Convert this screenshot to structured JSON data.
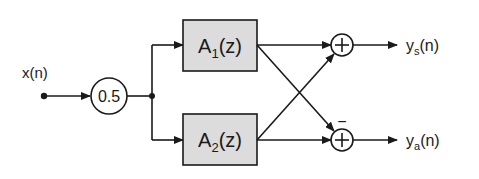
{
  "diagram": {
    "colors": {
      "line": "#1a1a1a",
      "block_fill": "#dcdcdc",
      "background": "#ffffff"
    },
    "input": {
      "label": "x(n)"
    },
    "gain": {
      "label": "0.5"
    },
    "blocks": [
      {
        "id": "A1",
        "base": "A",
        "sub": "1",
        "arg": "(z)"
      },
      {
        "id": "A2",
        "base": "A",
        "sub": "2",
        "arg": "(z)"
      }
    ],
    "adders": [
      {
        "id": "top",
        "symbol": "+",
        "sign_label": ""
      },
      {
        "id": "bottom",
        "symbol": "+",
        "sign_label": "−"
      }
    ],
    "outputs": [
      {
        "id": "ys",
        "base": "y",
        "sub": "s",
        "arg": "(n)"
      },
      {
        "id": "ya",
        "base": "y",
        "sub": "a",
        "arg": "(n)"
      }
    ],
    "connections": [
      "x(n) → 0.5",
      "0.5 → A1(z)",
      "0.5 → A2(z)",
      "A1(z) → top adder",
      "A1(z) → bottom adder (−)",
      "A2(z) → top adder",
      "A2(z) → bottom adder",
      "top adder → ys(n)",
      "bottom adder → ya(n)"
    ]
  }
}
